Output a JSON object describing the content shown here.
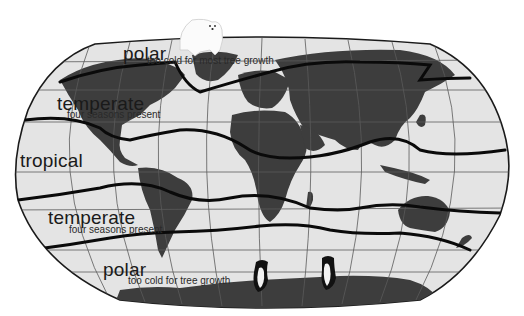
{
  "figure": {
    "colors": {
      "ocean": "#e4e4e4",
      "land": "#3d3d3d",
      "boundary": "#0a0a0a",
      "graticule": "#5a5a5a",
      "text": "#1a1a1a"
    }
  },
  "zones": [
    {
      "id": "polar-north",
      "title": "polar",
      "subtitle": "too cold for most tree growth"
    },
    {
      "id": "temperate-north",
      "title": "temperate",
      "subtitle": "four seasons present"
    },
    {
      "id": "tropical",
      "title": "tropical",
      "subtitle": ""
    },
    {
      "id": "temperate-south",
      "title": "temperate",
      "subtitle": "four seasons present"
    },
    {
      "id": "polar-south",
      "title": "polar",
      "subtitle": "too cold for tree growth"
    }
  ],
  "illustrations": [
    {
      "id": "polar-bear",
      "description": "polar bear at north pole"
    },
    {
      "id": "penguin-1",
      "description": "penguin on Antarctica"
    },
    {
      "id": "penguin-2",
      "description": "penguin on Antarctica"
    }
  ]
}
